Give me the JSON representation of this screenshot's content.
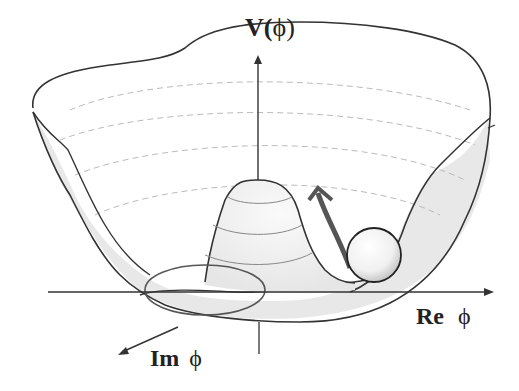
{
  "diagram": {
    "labels": {
      "v_axis": "V(",
      "v_axis_phi": "ϕ",
      "v_axis_close": ")",
      "re_axis": "Re",
      "re_axis_phi": "ϕ",
      "im_axis": "Im",
      "im_axis_phi": "ϕ"
    },
    "elements": [
      "potential-surface",
      "central-hump",
      "ball",
      "arrow"
    ],
    "colors": {
      "stroke": "#333333",
      "fill_shade": "#e8e8e8",
      "contour": "#aaaaaa",
      "arrow": "#555555",
      "background": "#ffffff"
    }
  }
}
